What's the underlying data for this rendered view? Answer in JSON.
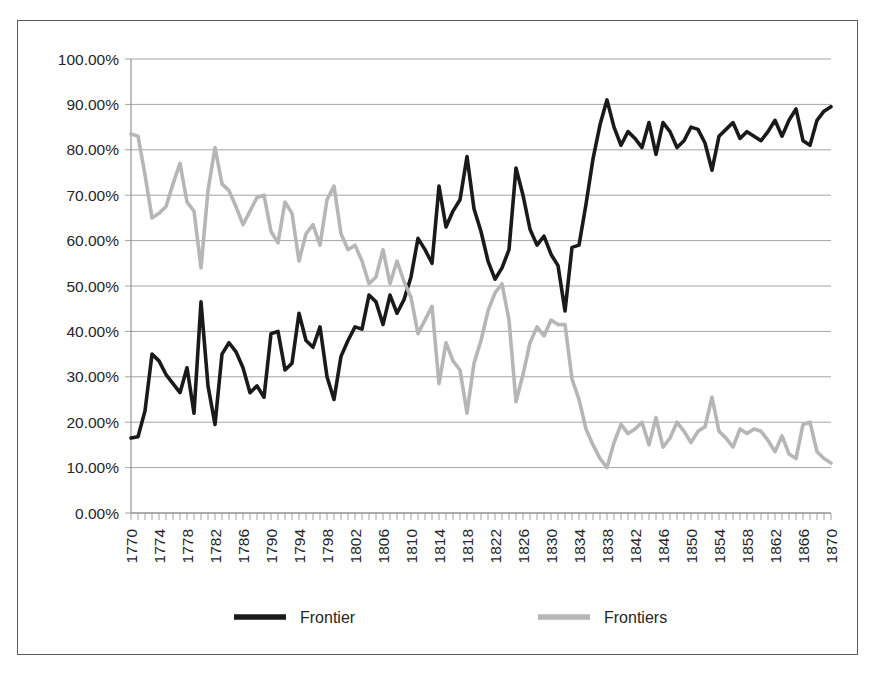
{
  "chart_data": {
    "type": "line",
    "title": "",
    "subtitle": "",
    "xlabel": "",
    "ylabel": "",
    "xlim": [
      1770,
      1870
    ],
    "ylim": [
      0,
      100
    ],
    "grid": true,
    "legend_position": "bottom",
    "y_ticks": [
      "0.00%",
      "10.00%",
      "20.00%",
      "30.00%",
      "40.00%",
      "50.00%",
      "60.00%",
      "70.00%",
      "80.00%",
      "90.00%",
      "100.00%"
    ],
    "y_tick_values": [
      0,
      10,
      20,
      30,
      40,
      50,
      60,
      70,
      80,
      90,
      100
    ],
    "x_tick_labels": [
      "1770",
      "1774",
      "1778",
      "1782",
      "1786",
      "1790",
      "1794",
      "1798",
      "1802",
      "1806",
      "1810",
      "1814",
      "1818",
      "1822",
      "1826",
      "1830",
      "1834",
      "1838",
      "1842",
      "1846",
      "1850",
      "1854",
      "1858",
      "1862",
      "1866",
      "1870"
    ],
    "x_tick_values": [
      1770,
      1774,
      1778,
      1782,
      1786,
      1790,
      1794,
      1798,
      1802,
      1806,
      1810,
      1814,
      1818,
      1822,
      1826,
      1830,
      1834,
      1838,
      1842,
      1846,
      1850,
      1854,
      1858,
      1862,
      1866,
      1870
    ],
    "x": [
      1770,
      1771,
      1772,
      1773,
      1774,
      1775,
      1776,
      1777,
      1778,
      1779,
      1780,
      1781,
      1782,
      1783,
      1784,
      1785,
      1786,
      1787,
      1788,
      1789,
      1790,
      1791,
      1792,
      1793,
      1794,
      1795,
      1796,
      1797,
      1798,
      1799,
      1800,
      1801,
      1802,
      1803,
      1804,
      1805,
      1806,
      1807,
      1808,
      1809,
      1810,
      1811,
      1812,
      1813,
      1814,
      1815,
      1816,
      1817,
      1818,
      1819,
      1820,
      1821,
      1822,
      1823,
      1824,
      1825,
      1826,
      1827,
      1828,
      1829,
      1830,
      1831,
      1832,
      1833,
      1834,
      1835,
      1836,
      1837,
      1838,
      1839,
      1840,
      1841,
      1842,
      1843,
      1844,
      1845,
      1846,
      1847,
      1848,
      1849,
      1850,
      1851,
      1852,
      1853,
      1854,
      1855,
      1856,
      1857,
      1858,
      1859,
      1860,
      1861,
      1862,
      1863,
      1864,
      1865,
      1866,
      1867,
      1868,
      1869,
      1870
    ],
    "series": [
      {
        "name": "Frontier",
        "color": "#1a1a1a",
        "line_width": 3.6,
        "values": [
          16.5,
          16.8,
          22.5,
          35.0,
          33.5,
          30.5,
          28.5,
          26.5,
          32.0,
          22.0,
          46.5,
          28.0,
          19.5,
          35.0,
          37.5,
          35.5,
          32.0,
          26.5,
          28.0,
          25.5,
          39.5,
          40.0,
          31.5,
          33.0,
          44.0,
          38.0,
          36.5,
          41.0,
          30.0,
          25.0,
          34.5,
          38.0,
          41.0,
          40.5,
          48.0,
          46.5,
          41.5,
          48.0,
          44.0,
          47.0,
          52.0,
          60.5,
          58.0,
          55.0,
          72.0,
          63.0,
          66.5,
          69.0,
          78.5,
          67.0,
          62.0,
          55.5,
          51.5,
          54.0,
          58.0,
          76.0,
          70.0,
          62.5,
          59.0,
          61.0,
          57.0,
          54.5,
          44.5,
          58.5,
          59.0,
          68.0,
          78.0,
          85.5,
          91.0,
          85.0,
          81.0,
          84.0,
          82.5,
          80.5,
          86.0,
          79.0,
          86.0,
          84.0,
          80.5,
          82.0,
          85.0,
          84.5,
          81.5,
          75.5,
          83.0,
          84.5,
          86.0,
          82.5,
          84.0,
          83.0,
          82.0,
          84.0,
          86.5,
          83.0,
          86.5,
          89.0,
          82.0,
          81.0,
          86.5,
          88.5,
          89.5
        ]
      },
      {
        "name": "Frontiers",
        "color": "#b6b6b6",
        "line_width": 3.6,
        "values": [
          83.5,
          83.0,
          74.5,
          65.0,
          66.0,
          67.5,
          72.5,
          77.0,
          68.5,
          66.5,
          54.0,
          71.0,
          80.5,
          72.5,
          71.0,
          67.5,
          63.5,
          66.5,
          69.5,
          70.0,
          62.0,
          59.5,
          68.5,
          66.0,
          55.5,
          61.5,
          63.5,
          59.0,
          69.0,
          72.0,
          61.5,
          58.0,
          59.0,
          55.5,
          50.5,
          52.0,
          58.0,
          50.5,
          55.5,
          51.0,
          47.5,
          39.5,
          42.5,
          45.5,
          28.5,
          37.5,
          33.5,
          31.5,
          22.0,
          33.0,
          38.0,
          44.5,
          48.5,
          50.5,
          42.5,
          24.5,
          30.5,
          37.5,
          41.0,
          39.0,
          42.5,
          41.5,
          41.5,
          29.5,
          25.0,
          18.5,
          15.0,
          12.0,
          10.0,
          15.5,
          19.5,
          17.5,
          18.5,
          20.0,
          15.0,
          21.0,
          14.5,
          16.5,
          20.0,
          18.0,
          15.5,
          18.0,
          19.0,
          25.5,
          18.0,
          16.5,
          14.5,
          18.5,
          17.5,
          18.5,
          18.0,
          16.0,
          13.5,
          17.0,
          13.0,
          12.0,
          19.5,
          20.0,
          13.5,
          12.0,
          11.0
        ]
      }
    ]
  },
  "legend": {
    "items": [
      {
        "label": "Frontier",
        "color": "#1a1a1a"
      },
      {
        "label": "Frontiers",
        "color": "#b6b6b6"
      }
    ]
  },
  "axes": {
    "y_axis_name": "percentage-axis",
    "x_axis_name": "year-axis"
  }
}
